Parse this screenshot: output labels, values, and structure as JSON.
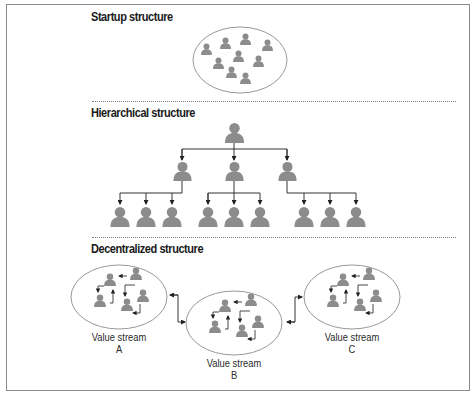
{
  "diagram": {
    "sections": [
      {
        "id": "startup",
        "title": "Startup structure",
        "people_count": 10
      },
      {
        "id": "hierarchical",
        "title": "Hierarchical structure",
        "levels": [
          1,
          3,
          9
        ]
      },
      {
        "id": "decentralized",
        "title": "Decentralized structure",
        "value_streams": [
          {
            "label_line1": "Value stream",
            "label_line2": "A",
            "people_count": 5
          },
          {
            "label_line1": "Value stream",
            "label_line2": "B",
            "people_count": 5
          },
          {
            "label_line1": "Value stream",
            "label_line2": "C",
            "people_count": 5
          }
        ]
      }
    ],
    "colors": {
      "person": "#8c8c8c",
      "ellipse": "#8a8a8a",
      "line": "#333333",
      "divider": "#777777"
    }
  }
}
